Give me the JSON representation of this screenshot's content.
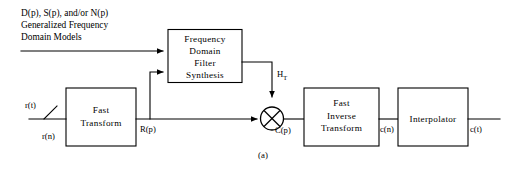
{
  "figure": {
    "caption": "(a)",
    "annotation_lines": [
      "D(p), S(p), and/or N(p)",
      "Generalized Frequency",
      "Domain Models"
    ]
  },
  "blocks": {
    "frequency_filter": {
      "lines": [
        "Frequency",
        "Domain",
        "Filter",
        "Synthesis"
      ]
    },
    "fast_transform": {
      "lines": [
        "Fast",
        "Transform"
      ]
    },
    "fast_inverse_transform": {
      "lines": [
        "Fast",
        "Inverse",
        "Transform"
      ]
    },
    "interpolator": {
      "lines": [
        "Interpolator"
      ]
    }
  },
  "signals": {
    "input_continuous": "r(t)",
    "input_sampled": "r(n)",
    "transform_output": "R(p)",
    "filter_transfer_base": "H",
    "filter_transfer_sub": "T",
    "multiplier_output": "C(p)",
    "inverse_output": "c(n)",
    "final_output": "c(t)"
  },
  "colors": {
    "ink": "#000000",
    "paper": "#ffffff"
  }
}
